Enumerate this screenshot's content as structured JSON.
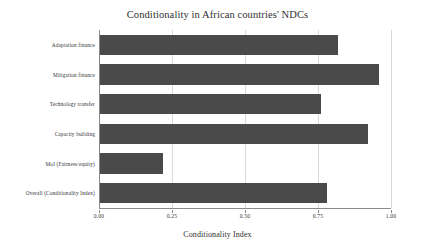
{
  "chart_data": {
    "type": "bar",
    "orientation": "horizontal",
    "title": "Conditionality in African countries' NDCs",
    "xlabel": "Conditionality Index",
    "ylabel": "",
    "categories": [
      "Adaptation finance",
      "Mitigation finance",
      "Technology transfer",
      "Capacity building",
      "MoI (Fairness/equity)",
      "Overall (Conditionality Index)"
    ],
    "values": [
      0.82,
      0.96,
      0.76,
      0.92,
      0.22,
      0.78
    ],
    "xlim": [
      0.0,
      1.0
    ],
    "xticks": [
      "0.00",
      "0.25",
      "0.50",
      "0.75",
      "1.00"
    ],
    "xtick_values": [
      0.0,
      0.25,
      0.5,
      0.75,
      1.0
    ],
    "grid": "vertical",
    "legend": "none",
    "bar_color": "#4a4a4a",
    "grid_color": "#d9d9d9",
    "axis_color": "#8a8a8a",
    "background": "#ffffff"
  }
}
